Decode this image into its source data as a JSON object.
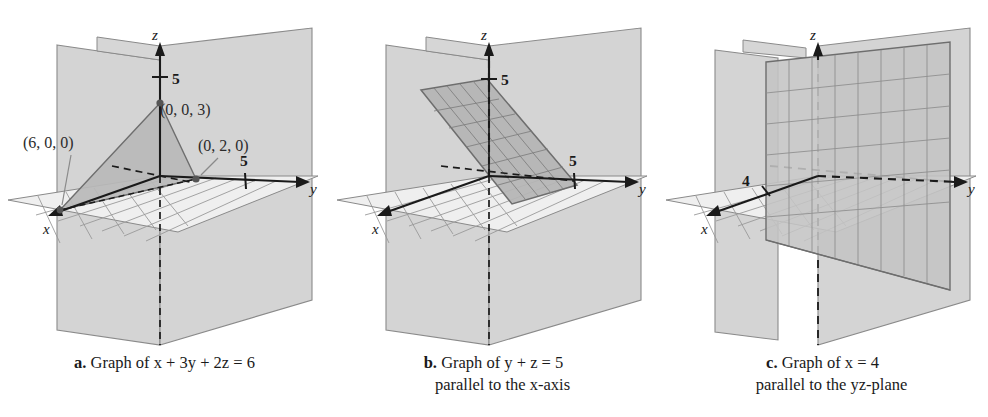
{
  "figure": {
    "panels": [
      {
        "id": "a",
        "caption_label": "a.",
        "caption_line1": "Graph of x + 3y + 2z = 6",
        "caption_line2": "",
        "equation": "x + 3y + 2z = 6",
        "axis_labels": {
          "x": "x",
          "y": "y",
          "z": "z"
        },
        "ticks": [
          {
            "axis": "z",
            "label": "5"
          },
          {
            "axis": "y",
            "label": "5"
          }
        ],
        "point_labels": [
          {
            "text": "(6, 0, 0)",
            "point": "x-intercept"
          },
          {
            "text": "(0, 0, 3)",
            "point": "z-intercept"
          },
          {
            "text": "(0, 2, 0)",
            "point": "y-intercept"
          }
        ],
        "surface": "triangle"
      },
      {
        "id": "b",
        "caption_label": "b.",
        "caption_line1": "Graph of y + z = 5",
        "caption_line2": "parallel to the x-axis",
        "equation": "y + z = 5",
        "axis_labels": {
          "x": "x",
          "y": "y",
          "z": "z"
        },
        "ticks": [
          {
            "axis": "z",
            "label": "5"
          },
          {
            "axis": "y",
            "label": "5"
          }
        ],
        "point_labels": [],
        "surface": "slanted-gridded-plane"
      },
      {
        "id": "c",
        "caption_label": "c.",
        "caption_line1": "Graph of x = 4",
        "caption_line2": "parallel to the yz-plane",
        "equation": "x = 4",
        "axis_labels": {
          "x": "x",
          "y": "y",
          "z": "z"
        },
        "ticks": [
          {
            "axis": "x",
            "label": "4"
          }
        ],
        "point_labels": [],
        "surface": "vertical-gridded-plane"
      }
    ]
  },
  "colors": {
    "plane_fill": "#d4d4d4",
    "plane_edge": "#8a8a8a",
    "surface_fill": "#b9b9b9",
    "surface_edge": "#6e6e6e",
    "grid_line": "#9a9a9a",
    "axis": "#1a1a1a",
    "background": "#ffffff",
    "label_text": "#2b2b2b"
  }
}
